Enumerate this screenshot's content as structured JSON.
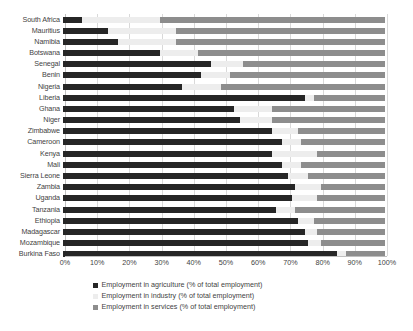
{
  "chart_data": {
    "type": "bar",
    "orientation": "horizontal",
    "stacked": true,
    "title": "",
    "xlabel": "",
    "ylabel": "",
    "xlim": [
      0,
      100
    ],
    "xtick_labels": [
      "0%",
      "10%",
      "20%",
      "30%",
      "40%",
      "50%",
      "60%",
      "70%",
      "80%",
      "90%",
      "100%"
    ],
    "xtick_values": [
      0,
      10,
      20,
      30,
      40,
      50,
      60,
      70,
      80,
      90,
      100
    ],
    "grid": true,
    "legend_position": "bottom",
    "categories": [
      "South Africa",
      "Mauritius",
      "Namibia",
      "Botswana",
      "Senegal",
      "Benin",
      "Nigeria",
      "Liberia",
      "Ghana",
      "Niger",
      "Zimbabwe",
      "Cameroon",
      "Kenya",
      "Mali",
      "Sierra Leone",
      "Zambia",
      "Uganda",
      "Tanzania",
      "Ethiopia",
      "Madagascar",
      "Mozambique",
      "Burkina Faso"
    ],
    "series": [
      {
        "name": "Employment in agriculture (% of total employment)",
        "color": "#262626",
        "values": [
          6,
          14,
          17,
          30,
          46,
          43,
          37,
          75,
          53,
          55,
          65,
          68,
          65,
          68,
          70,
          72,
          71,
          66,
          73,
          75,
          76,
          85
        ]
      },
      {
        "name": "Employment in industry (% of total employment)",
        "color": "#ededed",
        "values": [
          24,
          21,
          18,
          12,
          10,
          9,
          12,
          3,
          12,
          10,
          8,
          6,
          14,
          6,
          6,
          8,
          8,
          6,
          5,
          4,
          4,
          3
        ]
      },
      {
        "name": "Employment in services (% of total employment)",
        "color": "#8d8d8d",
        "values": [
          70,
          65,
          65,
          58,
          44,
          48,
          51,
          22,
          35,
          35,
          27,
          26,
          21,
          26,
          24,
          20,
          21,
          28,
          22,
          21,
          20,
          12
        ]
      }
    ]
  }
}
